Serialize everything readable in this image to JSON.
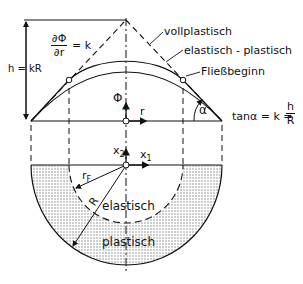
{
  "diagram": {
    "labels": {
      "vollplastisch": "vollplastisch",
      "elastisch_plastisch": "elastisch - plastisch",
      "fliessbeginn": "Fließbeginn",
      "h_eq": "h = kR",
      "dphi_num": "∂Φ",
      "dphi_den": "∂r",
      "dphi_eq": "= k",
      "phi": "Φ",
      "r": "r",
      "alpha": "α",
      "tan_prefix": "tanα = k =",
      "tan_num": "h",
      "tan_den": "R",
      "x2": "x",
      "x2_sub": "2",
      "x1": "x",
      "x1_sub": "1",
      "rF": "r",
      "rF_sub": "F",
      "R": "R",
      "elastisch": "elastisch",
      "plastisch": "plastisch"
    },
    "colors": {
      "line": "#111111",
      "hatch": "#9a9a9a",
      "background": "#ffffff"
    }
  }
}
